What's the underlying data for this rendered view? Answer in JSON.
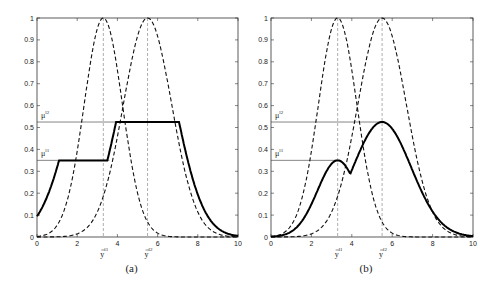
{
  "chart_data": [
    {
      "type": "line",
      "caption": "(a)",
      "xlim": [
        0,
        10
      ],
      "ylim": [
        0,
        1
      ],
      "xticks": [
        "0",
        "2",
        "4",
        "6",
        "8",
        "10"
      ],
      "yticks": [
        "0",
        "0.1",
        "0.2",
        "0.3",
        "0.4",
        "0.5",
        "0.6",
        "0.7",
        "0.8",
        "0.9",
        "1"
      ],
      "annotations": {
        "mu_l1": {
          "label": "μ",
          "sup": "l1",
          "y": 0.35
        },
        "mu_l2": {
          "label": "μ",
          "sup": "l2",
          "y": 0.525
        },
        "ybar_l1": {
          "label": "y",
          "sup": "l1",
          "x": 3.3
        },
        "ybar_l2": {
          "label": "y",
          "sup": "l2",
          "x": 5.5
        }
      },
      "series": [
        {
          "name": "consequent MF l1 (dashed)",
          "style": "dashed",
          "center": 3.3,
          "sigma": 0.95
        },
        {
          "name": "consequent MF l2 (dashed)",
          "style": "dashed",
          "center": 5.5,
          "sigma": 1.2
        },
        {
          "name": "clipped union (solid)",
          "style": "solid",
          "x": [
            0,
            1,
            1.8,
            3.6,
            4.0,
            7.0,
            8,
            9,
            10
          ],
          "y": [
            0,
            0.1,
            0.35,
            0.35,
            0.525,
            0.525,
            0.2,
            0.03,
            0
          ]
        }
      ]
    },
    {
      "type": "line",
      "caption": "(b)",
      "xlim": [
        0,
        10
      ],
      "ylim": [
        0,
        1
      ],
      "xticks": [
        "0",
        "2",
        "4",
        "6",
        "8",
        "10"
      ],
      "yticks": [
        "0",
        "0.1",
        "0.2",
        "0.3",
        "0.4",
        "0.5",
        "0.6",
        "0.7",
        "0.8",
        "0.9",
        "1"
      ],
      "annotations": {
        "mu_l1": {
          "label": "μ",
          "sup": "l1",
          "y": 0.35
        },
        "mu_l2": {
          "label": "μ",
          "sup": "l2",
          "y": 0.525
        },
        "ybar_l1": {
          "label": "y",
          "sup": "l1",
          "x": 3.3
        },
        "ybar_l2": {
          "label": "y",
          "sup": "l2",
          "x": 5.5
        }
      },
      "series": [
        {
          "name": "consequent MF l1 (dashed)",
          "style": "dashed",
          "center": 3.3,
          "sigma": 0.95
        },
        {
          "name": "consequent MF l2 (dashed)",
          "style": "dashed",
          "center": 5.5,
          "sigma": 1.2
        },
        {
          "name": "scaled union (solid)",
          "style": "solid",
          "x": [
            0,
            1,
            2,
            3.3,
            4.0,
            5.5,
            7,
            8,
            9,
            10
          ],
          "y": [
            0,
            0.02,
            0.13,
            0.35,
            0.27,
            0.525,
            0.25,
            0.08,
            0.01,
            0
          ]
        }
      ]
    }
  ]
}
